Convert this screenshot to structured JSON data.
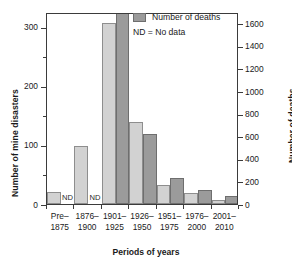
{
  "chart_data": {
    "type": "bar",
    "title": "",
    "xlabel": "Periods of years",
    "ylabel_left": "Number of mine disasters",
    "ylabel_right": "Number of deaths",
    "grid": false,
    "legend_position": "top-right",
    "categories": [
      "Pre–\n1875",
      "1876–\n1900",
      "1901–\n1925",
      "1926–\n1950",
      "1951–\n1975",
      "1976–\n2000",
      "2001–\n2010"
    ],
    "category_lines": [
      {
        "line1": "Pre–",
        "line2": "1875"
      },
      {
        "line1": "1876–",
        "line2": "1900"
      },
      {
        "line1": "1901–",
        "line2": "1925"
      },
      {
        "line1": "1926–",
        "line2": "1950"
      },
      {
        "line1": "1951–",
        "line2": "1975"
      },
      {
        "line1": "1976–",
        "line2": "2000"
      },
      {
        "line1": "2001–",
        "line2": "2010"
      }
    ],
    "series": [
      {
        "name": "Number of mine disasters",
        "axis": "left",
        "color": "#d2d2d2",
        "values": [
          20,
          99,
          307,
          139,
          32,
          18,
          6
        ]
      },
      {
        "name": "Number of deaths",
        "axis": "right",
        "color": "#9b9b9b",
        "values": [
          null,
          null,
          1720,
          620,
          230,
          125,
          75
        ],
        "nodata_labels": [
          "ND",
          "ND"
        ],
        "clipped_bars": [
          2
        ]
      }
    ],
    "left_axis": {
      "label": "Number of mine disasters",
      "ticks": [
        0,
        100,
        200,
        300
      ],
      "tick_labels": [
        "0",
        "100",
        "200",
        "300"
      ],
      "minor_ticks": [
        50,
        150,
        250,
        350
      ],
      "ylim": [
        0,
        325
      ]
    },
    "right_axis": {
      "label": "Number of deaths",
      "ticks": [
        0,
        200,
        400,
        600,
        800,
        1000,
        1200,
        1400,
        1600
      ],
      "tick_labels": [
        "0",
        "200",
        "400",
        "600",
        "800",
        "1000",
        "1200",
        "1400",
        "1600"
      ],
      "ylim": [
        0,
        1700
      ]
    },
    "annotations": [
      {
        "text": "ND",
        "category": "Pre–1875",
        "meaning": "No data"
      },
      {
        "text": "ND",
        "category": "1876–1900",
        "meaning": "No data"
      }
    ]
  },
  "legend": {
    "entry_label": "Number of deaths",
    "note": "ND = No data",
    "swatch_color": "#9b9b9b"
  },
  "axes": {
    "x_title": "Periods of years",
    "y_title_left": "Number of mine disasters",
    "y_title_right": "Number of deaths"
  }
}
